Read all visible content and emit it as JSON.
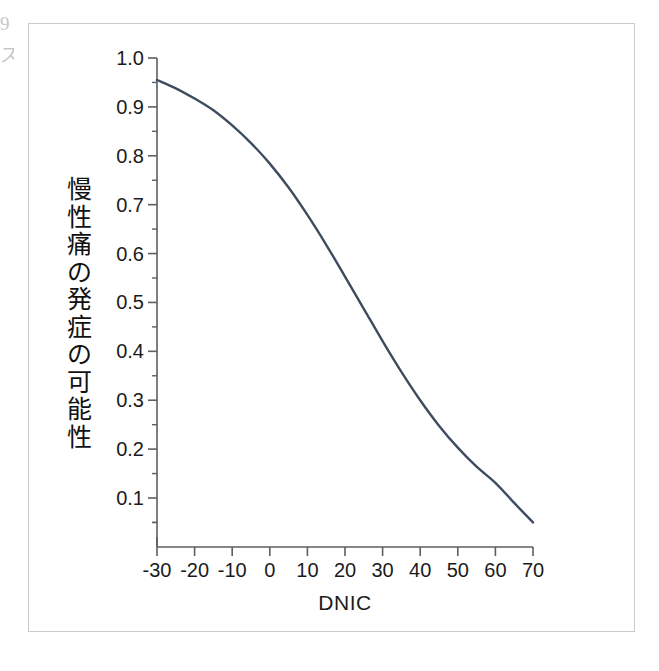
{
  "figure": {
    "background_color": "#ffffff",
    "frame_color": "#c9cccd",
    "axis_color": "#5a5f63",
    "text_color": "#1b1b1b",
    "curve_color": "#3d4c5e"
  },
  "edge_artifacts": {
    "glyph_top": "9",
    "glyph_bottom": "ス"
  },
  "axis_titles": {
    "x": "DNIC",
    "y_vertical_chars": [
      "慢",
      "性",
      "痛",
      "の",
      "発",
      "症",
      "の",
      "可",
      "能",
      "性"
    ],
    "y_text": "慢性痛の発症の可能性"
  },
  "chart_data": {
    "type": "line",
    "title": "",
    "xlabel": "DNIC",
    "ylabel": "慢性痛の発症の可能性",
    "xlim": [
      -30,
      70
    ],
    "ylim": [
      0.0,
      1.0
    ],
    "xticks": [
      -30,
      -20,
      -10,
      0,
      10,
      20,
      30,
      40,
      50,
      60,
      70
    ],
    "xtick_labels": [
      "-30",
      "-20",
      "-10",
      "0",
      "10",
      "20",
      "30",
      "40",
      "50",
      "60",
      "70"
    ],
    "yticks": [
      0.1,
      0.2,
      0.3,
      0.4,
      0.5,
      0.6,
      0.7,
      0.8,
      0.9,
      1.0
    ],
    "ytick_labels": [
      "0.1",
      "0.2",
      "0.3",
      "0.4",
      "0.5",
      "0.6",
      "0.7",
      "0.8",
      "0.9",
      "1.0"
    ],
    "y_minor_ticks": [
      0.05,
      0.15,
      0.25,
      0.35,
      0.45,
      0.55,
      0.65,
      0.75,
      0.85,
      0.95
    ],
    "grid": false,
    "legend": null,
    "series": [
      {
        "name": "predicted probability",
        "color": "#3d4c5e",
        "line_width": 2.4,
        "x": [
          -30,
          -25,
          -20,
          -15,
          -10,
          -5,
          0,
          5,
          10,
          15,
          20,
          25,
          30,
          35,
          40,
          45,
          50,
          55,
          60,
          65,
          70
        ],
        "y": [
          0.955,
          0.938,
          0.917,
          0.893,
          0.862,
          0.826,
          0.784,
          0.735,
          0.679,
          0.618,
          0.553,
          0.487,
          0.421,
          0.358,
          0.3,
          0.248,
          0.203,
          0.164,
          0.131,
          0.09,
          0.05
        ]
      }
    ]
  }
}
